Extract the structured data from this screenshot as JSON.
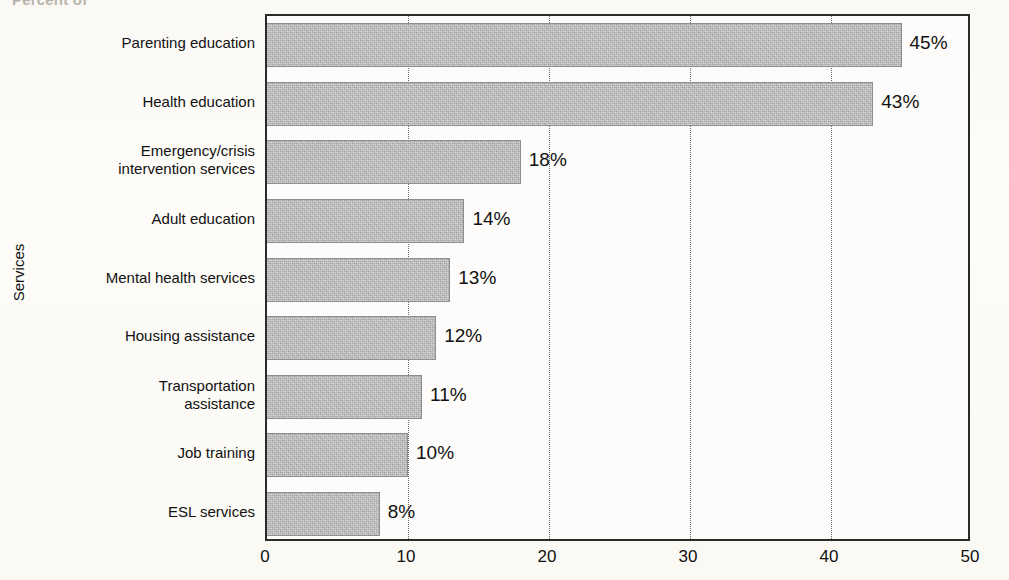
{
  "top_caption": "Percent of",
  "chart_data": {
    "type": "bar",
    "orientation": "horizontal",
    "title": "",
    "xlabel": "",
    "ylabel": "Services",
    "xlim": [
      0,
      50
    ],
    "xticks": [
      0,
      10,
      20,
      30,
      40,
      50
    ],
    "xtick_labels": [
      "0",
      "10",
      "20",
      "30",
      "40",
      "50"
    ],
    "grid": "vertical-dotted",
    "legend": "none",
    "value_suffix": "%",
    "bar_color": "#a9a9a9",
    "axis_color": "#2a2a2a",
    "categories": [
      "Parenting education",
      "Health education",
      "Emergency/crisis\nintervention services",
      "Adult education",
      "Mental health services",
      "Housing assistance",
      "Transportation\nassistance",
      "Job training",
      "ESL services"
    ],
    "values": [
      45,
      43,
      18,
      14,
      13,
      12,
      11,
      10,
      8
    ],
    "value_labels": [
      "45%",
      "43%",
      "18%",
      "14%",
      "13%",
      "12%",
      "11%",
      "10%",
      "8%"
    ]
  }
}
